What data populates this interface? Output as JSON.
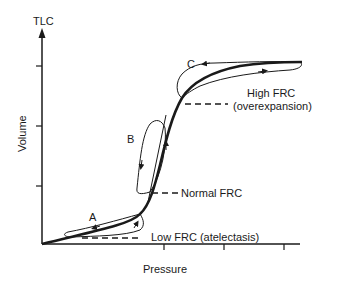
{
  "diagram": {
    "title": "",
    "y_axis": {
      "label": "Volume",
      "top_label": "TLC"
    },
    "x_axis": {
      "label": "Pressure"
    },
    "loops": [
      {
        "id": "A",
        "label": "A"
      },
      {
        "id": "B",
        "label": "B"
      },
      {
        "id": "C",
        "label": "C"
      }
    ],
    "annotations": {
      "high_frc": "High FRC",
      "high_frc_sub": "(overexpansion)",
      "normal_frc": "Normal FRC",
      "low_frc": "Low FRC (atelectasis)"
    },
    "colors": {
      "line": "#1a1a1a",
      "background": "#ffffff"
    }
  }
}
